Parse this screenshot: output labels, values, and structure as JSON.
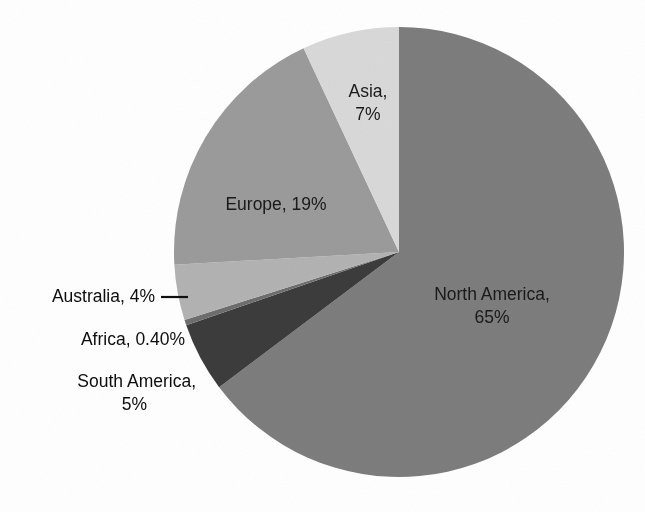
{
  "chart_data": {
    "type": "pie",
    "title": "",
    "subtitle": "",
    "xlabel": "",
    "ylabel": "",
    "legend_position": "none",
    "grid": false,
    "start_angle_deg": 0,
    "direction": "clockwise",
    "categories": [
      "North America",
      "South America",
      "Africa",
      "Australia",
      "Europe",
      "Asia"
    ],
    "values": [
      65,
      5,
      0.4,
      4,
      19,
      7
    ],
    "value_unit": "%",
    "labels": [
      "North America, 65%",
      "South America, 5%",
      "Africa, 0.40%",
      "Australia, 4%",
      "Europe, 19%",
      "Asia, 7%"
    ],
    "colors": [
      "#7d7d7d",
      "#3c3c3c",
      "#6e6e6e",
      "#b3b3b3",
      "#9b9b9b",
      "#d9d9d9"
    ],
    "slices": [
      {
        "name": "North America",
        "value": 65,
        "display_value": "65%",
        "label_line_1": "North America,",
        "label_line_2": "65%",
        "label_placement": "inside",
        "color": "#7d7d7d"
      },
      {
        "name": "South America",
        "value": 5,
        "display_value": "5%",
        "label_line_1": "South America,",
        "label_line_2": "5%",
        "label_placement": "outside-left",
        "color": "#3c3c3c"
      },
      {
        "name": "Africa",
        "value": 0.4,
        "display_value": "0.40%",
        "label_line_1": "Africa, 0.40%",
        "label_line_2": "",
        "label_placement": "outside-left",
        "color": "#6e6e6e"
      },
      {
        "name": "Australia",
        "value": 4,
        "display_value": "4%",
        "label_line_1": "Australia, 4%",
        "label_line_2": "",
        "label_placement": "outside-left-with-leader",
        "color": "#b3b3b3"
      },
      {
        "name": "Europe",
        "value": 19,
        "display_value": "19%",
        "label_line_1": "Europe, 19%",
        "label_line_2": "",
        "label_placement": "inside",
        "color": "#9b9b9b"
      },
      {
        "name": "Asia",
        "value": 7,
        "display_value": "7%",
        "label_line_1": "Asia,",
        "label_line_2": "7%",
        "label_placement": "inside",
        "color": "#d9d9d9"
      }
    ]
  },
  "canvas": {
    "background": "#ffffff",
    "center_x": 399,
    "center_y": 252,
    "radius": 225
  }
}
